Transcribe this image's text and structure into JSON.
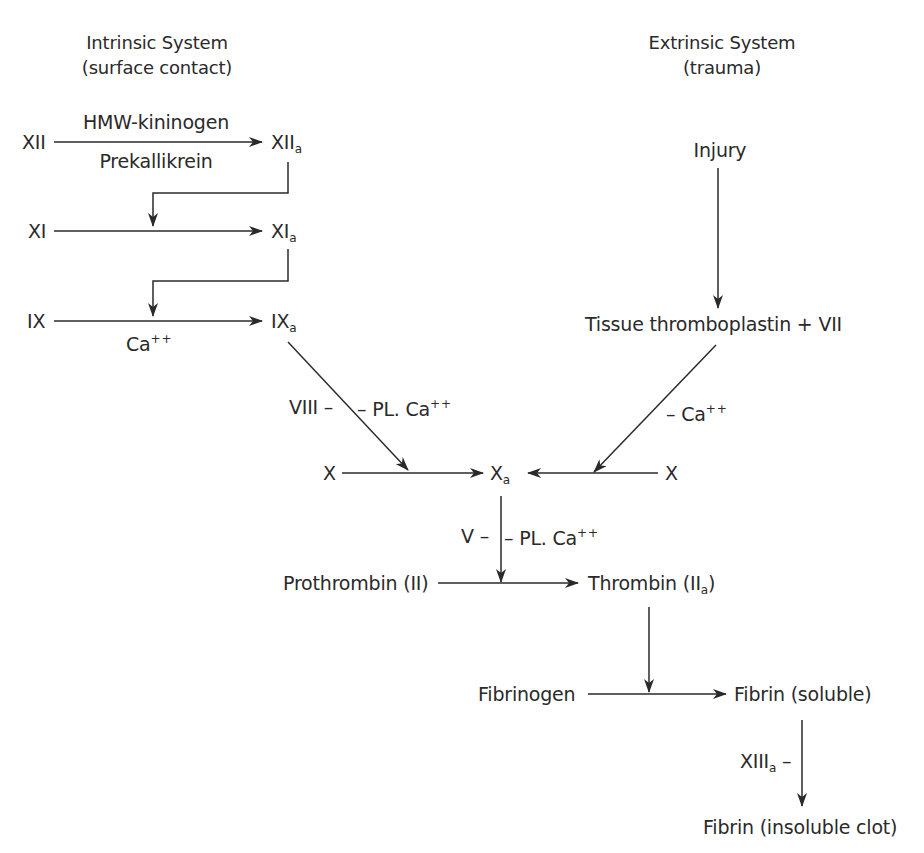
{
  "headers": {
    "intrinsic": {
      "title": "Intrinsic System",
      "subtitle": "(surface contact)"
    },
    "extrinsic": {
      "title": "Extrinsic System",
      "subtitle": "(trauma)"
    }
  },
  "intrinsic": {
    "xii": "XII",
    "xiia": {
      "base": "XII",
      "sub": "a"
    },
    "cofactor_top": "HMW-kininogen",
    "cofactor_bottom": "Prekallikrein",
    "xi": "XI",
    "xia": {
      "base": "XI",
      "sub": "a"
    },
    "ix": "IX",
    "ixa": {
      "base": "IX",
      "sub": "a"
    },
    "ix_cofactor": {
      "base": "Ca",
      "sup": "++"
    },
    "viii_label": "VIII –",
    "viii_right": {
      "base": "– PL. Ca",
      "sup": "++"
    }
  },
  "extrinsic": {
    "injury": "Injury",
    "tissue": "Tissue thromboplastin + VII",
    "ca_label": {
      "base": "– Ca",
      "sup": "++"
    }
  },
  "common": {
    "x_left": "X",
    "x_right": "X",
    "xa": {
      "base": "X",
      "sub": "a"
    },
    "v_label": "V –",
    "v_right": {
      "base": "– PL. Ca",
      "sup": "++"
    },
    "prothrombin": "Prothrombin (II)",
    "thrombin": {
      "base": "Thrombin (II",
      "sub": "a",
      "tail": ")"
    },
    "fibrinogen": "Fibrinogen",
    "fibrin_soluble": "Fibrin (soluble)",
    "xiiia": {
      "base": "XIII",
      "sub": "a",
      "tail": " –"
    },
    "fibrin_insoluble": "Fibrin (insoluble clot)"
  },
  "colors": {
    "ink": "#2a2a2a",
    "background": "#ffffff"
  }
}
